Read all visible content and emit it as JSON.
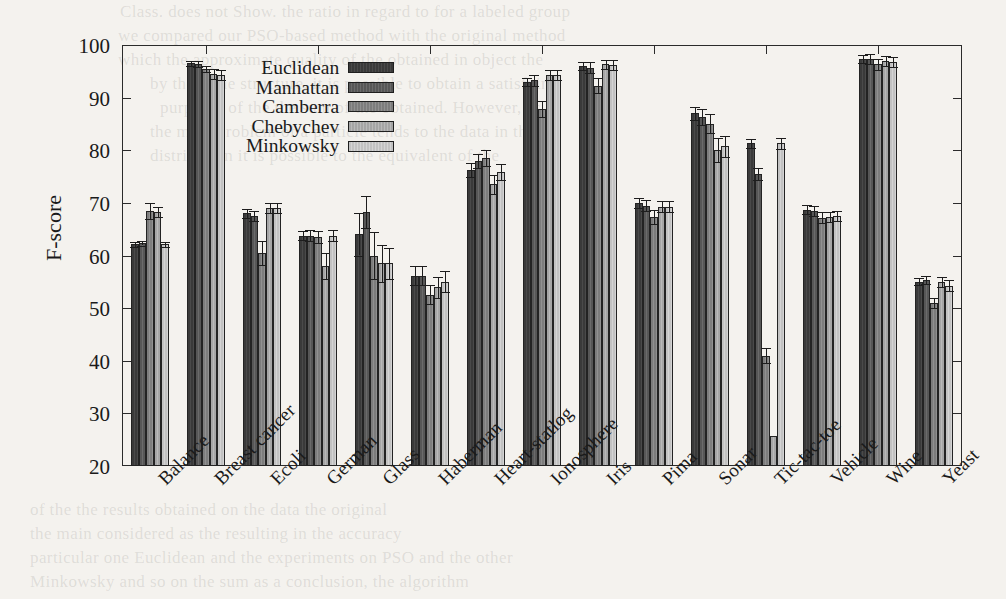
{
  "figure": {
    "y_axis_title": "F-score"
  },
  "ghost_text": [
    {
      "x": 120,
      "y": 2,
      "t": "Class. does not Show. the ratio in regard to for a labeled group"
    },
    {
      "x": 118,
      "y": 26,
      "t": "we compared our PSO-based method with the original method"
    },
    {
      "x": 118,
      "y": 50,
      "t": "which the approximate quality of the obtained in object the"
    },
    {
      "x": 150,
      "y": 74,
      "t": "by the same structure, it is possible to obtain a satisfying"
    },
    {
      "x": 160,
      "y": 98,
      "t": "purposes of the the sum of the obtained. However, as a"
    },
    {
      "x": 150,
      "y": 122,
      "t": "the main problem of a particle tends to the data in the"
    },
    {
      "x": 150,
      "y": 146,
      "t": "distribution it is possible to the equivalent of the"
    },
    {
      "x": 30,
      "y": 500,
      "t": "of the the results obtained on the data the original"
    },
    {
      "x": 30,
      "y": 524,
      "t": "the main considered as the resulting in the accuracy"
    },
    {
      "x": 30,
      "y": 548,
      "t": "particular one Euclidean and the experiments on PSO and the other"
    },
    {
      "x": 30,
      "y": 572,
      "t": "Minkowsky and so on the sum as a conclusion, the algorithm"
    }
  ],
  "legend": {
    "items": [
      {
        "label": "Euclidean",
        "color": "#3a3a3a"
      },
      {
        "label": "Manhattan",
        "color": "#575757"
      },
      {
        "label": "Camberra",
        "color": "#7d7d7d"
      },
      {
        "label": "Chebychev",
        "color": "#a5a5a5"
      },
      {
        "label": "Minkowsky",
        "color": "#c2c2c2"
      }
    ]
  },
  "chart_data": {
    "type": "bar",
    "title": "",
    "xlabel": "",
    "ylabel": "F-score",
    "ylim": [
      20,
      100
    ],
    "yticks": [
      20,
      30,
      40,
      50,
      60,
      70,
      80,
      90,
      100
    ],
    "grid": false,
    "legend_position": "top-center-left",
    "error_bars": true,
    "categories": [
      "Balance",
      "Breast cancer",
      "Ecoli",
      "German",
      "Glass",
      "Haberman",
      "Heart-statlog",
      "Ionosphere",
      "Iris",
      "Pima",
      "Sonar",
      "Tic-tac-toe",
      "Vehicle",
      "Wine",
      "Yeast"
    ],
    "series": [
      {
        "name": "Euclidean",
        "values": [
          62.1,
          96.5,
          68.0,
          63.8,
          64.0,
          56.2,
          76.3,
          93.0,
          96.0,
          70.0,
          87.0,
          81.3,
          68.7,
          97.3,
          55.0
        ],
        "errors": [
          0.4,
          0.4,
          0.9,
          0.8,
          4.0,
          1.8,
          1.3,
          0.8,
          0.8,
          0.9,
          1.3,
          0.8,
          0.9,
          0.8,
          0.7
        ]
      },
      {
        "name": "Manhattan",
        "values": [
          62.3,
          96.4,
          67.5,
          63.8,
          68.3,
          56.2,
          78.0,
          93.3,
          95.7,
          69.5,
          86.3,
          75.5,
          68.5,
          97.3,
          55.3
        ],
        "errors": [
          0.4,
          0.5,
          1.0,
          1.0,
          3.0,
          1.8,
          1.3,
          1.0,
          1.0,
          1.0,
          1.5,
          1.2,
          1.0,
          0.9,
          0.8
        ]
      },
      {
        "name": "Camberra",
        "values": [
          68.5,
          95.5,
          60.5,
          63.5,
          60.0,
          52.5,
          78.5,
          87.8,
          92.3,
          67.3,
          85.0,
          41.0,
          67.2,
          96.3,
          51.0
        ],
        "errors": [
          1.5,
          0.6,
          2.3,
          1.2,
          4.5,
          1.8,
          1.5,
          1.5,
          1.5,
          1.3,
          1.8,
          1.5,
          1.0,
          1.0,
          1.0
        ]
      },
      {
        "name": "Chebychev",
        "values": [
          68.3,
          94.5,
          69.0,
          58.0,
          58.5,
          54.0,
          73.5,
          94.3,
          96.3,
          69.3,
          80.0,
          25.7,
          67.3,
          97.0,
          55.0
        ],
        "errors": [
          0.9,
          0.9,
          1.0,
          2.5,
          3.5,
          2.0,
          1.8,
          0.9,
          0.9,
          1.0,
          2.3,
          0.0,
          1.0,
          1.0,
          1.0
        ]
      },
      {
        "name": "Minkowsky",
        "values": [
          62.1,
          94.3,
          69.0,
          63.8,
          58.5,
          55.0,
          75.8,
          94.3,
          96.2,
          69.3,
          80.8,
          81.3,
          67.5,
          96.8,
          54.3
        ],
        "errors": [
          0.4,
          1.0,
          1.0,
          1.0,
          3.0,
          2.0,
          1.5,
          1.0,
          1.0,
          1.0,
          2.0,
          1.0,
          1.0,
          1.0,
          1.0
        ]
      }
    ]
  }
}
